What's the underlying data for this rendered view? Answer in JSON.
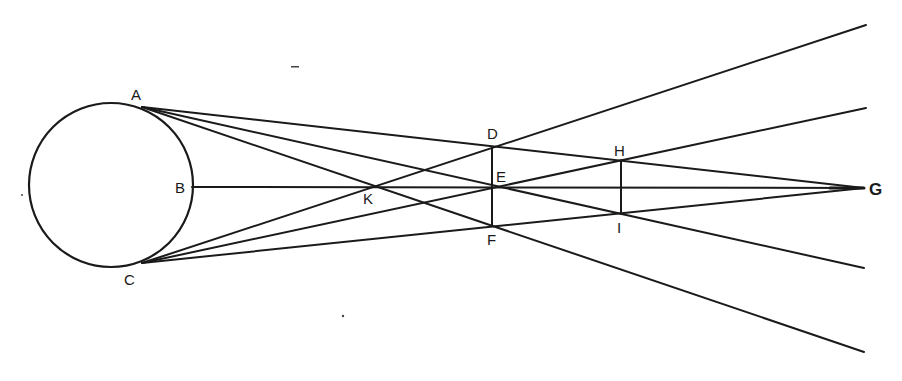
{
  "diagram": {
    "stroke_color": "#1a1a1a",
    "background": "#ffffff",
    "circle": {
      "cx": 111,
      "cy": 185,
      "r": 82
    },
    "points": {
      "A": {
        "x": 142,
        "y": 107
      },
      "B": {
        "x": 192,
        "y": 187
      },
      "C": {
        "x": 142,
        "y": 263
      },
      "D": {
        "x": 492,
        "y": 148
      },
      "E": {
        "x": 492,
        "y": 187
      },
      "F": {
        "x": 492,
        "y": 226
      },
      "G": {
        "x": 864,
        "y": 188
      },
      "H": {
        "x": 621,
        "y": 160
      },
      "I": {
        "x": 621,
        "y": 214
      },
      "K": {
        "x": 368,
        "y": 187
      }
    },
    "labels": {
      "A": "A",
      "B": "B",
      "C": "C",
      "D": "D",
      "E": "E",
      "F": "F",
      "G": "G",
      "H": "H",
      "I": "I",
      "K": "K"
    },
    "lines": [
      {
        "from": "A",
        "through": [
          "D",
          "H"
        ],
        "to": "G"
      },
      {
        "from": "C",
        "through": [
          "F",
          "I"
        ],
        "to": "G"
      },
      {
        "from": "B",
        "through": [
          "K",
          "E"
        ],
        "to": "G"
      },
      {
        "from": "A",
        "through": [
          "E",
          "I"
        ],
        "end": [
          864,
          268
        ]
      },
      {
        "from": "A",
        "through": [
          "K",
          "F"
        ],
        "end": [
          864,
          352
        ]
      },
      {
        "from": "C",
        "through": [
          "E",
          "H"
        ],
        "end": [
          866,
          108
        ]
      },
      {
        "from": "C",
        "through": [
          "K",
          "D"
        ],
        "end": [
          866,
          25
        ]
      },
      {
        "from": "D",
        "to": "F",
        "note": "vertical segment"
      },
      {
        "from": "H",
        "to": "I",
        "note": "vertical segment"
      }
    ]
  }
}
